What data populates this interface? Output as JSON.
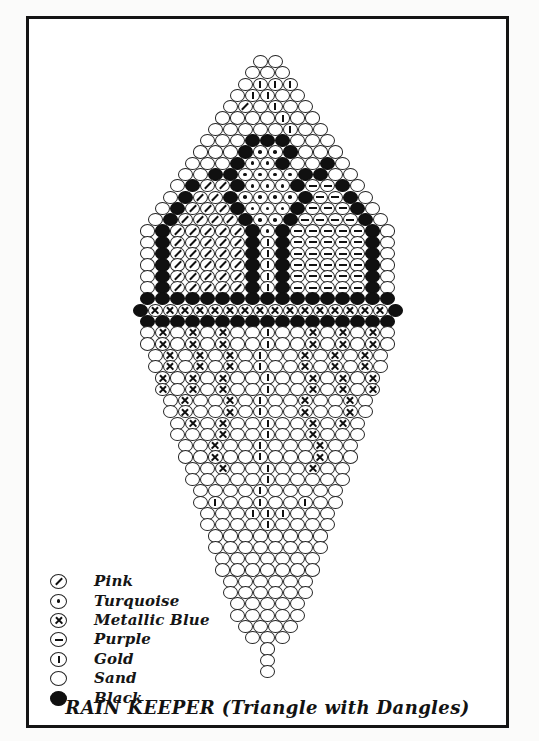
{
  "page": {
    "title": "RAIN KEEPER (Triangle with Dangles)"
  },
  "legend": {
    "items": [
      {
        "key": "P",
        "label": "Pink",
        "symbol": "circle-diagonal-slash"
      },
      {
        "key": "T",
        "label": "Turquoise",
        "symbol": "circle-center-dot"
      },
      {
        "key": "M",
        "label": "Metallic Blue",
        "symbol": "circle-x-cross"
      },
      {
        "key": "U",
        "label": "Purple",
        "symbol": "circle-horizontal-bar"
      },
      {
        "key": "G",
        "label": "Gold",
        "symbol": "circle-vertical-bar"
      },
      {
        "key": "S",
        "label": "Sand",
        "symbol": "circle-empty"
      },
      {
        "key": "B",
        "label": "Black",
        "symbol": "circle-filled"
      }
    ]
  },
  "pattern": {
    "colors": {
      "S": "Sand",
      "B": "Black",
      "P": "Pink",
      "T": "Turquoise",
      "M": "Metallic Blue",
      "U": "Purple",
      "G": "Gold"
    },
    "rows": [
      "SS",
      "SSS",
      "SGGG",
      "SGGSS",
      "SPSGSS",
      "SSSSGSS",
      "SSSSSGSS",
      "SSSBBBSSS",
      "SSSBTTBSSS",
      "SSSBTTBSSBS",
      "SSBBTTTTBBSS",
      "SBPPBTTTBUUBS",
      "SBPPBTTTTBUUBS",
      "SBPPPBTTTBUUUBS",
      "SBPPPPBTTBUUUUBS",
      "SBPPPPPBTBUUUUUBS",
      "SBPPPPPBGBUUUUUBS",
      "SBPPPPPBGBUUUUUBS",
      "SBPPPPPBGBUUUUUBS",
      "SBPPPPPBGBUUUUUBS",
      "SBPPPPPBGBUUUUUBS",
      "BBBBBBBBBBBBBBBBB",
      "BMMMMMMMMMMMMMMMMB",
      "BBBBBBBBBBBBBBBBB",
      "SMSMSMSSGSSMSMSMS",
      "SMSMSMSSGSSMSMSMS",
      "SMSMSMSGSSMSMSMS",
      "SMSMSMSGSSMSMSMS",
      "MSMSMSSGSSMSMSM",
      "MSMSMSSGSSMSMSM",
      "SMSSMSGSSMSSMS",
      "SMSSMSGSSMSSMS",
      "SMSMSSGSSMSMS",
      "SSSMSSGSSMSSS",
      "SSMSSGSSSMSS",
      "SSMSSGSSSMSS",
      "SSMSSGSSMSS",
      "SSSSSGSSSSS",
      "SSSSGSSSSS",
      "SGSSGSSGSS",
      "SSSGGGSSS",
      "SSSSGSSSS",
      "SSSSSSSS",
      "SSSSSSSS",
      "SSSSSSS",
      "SSSSSSS",
      "SSSSSS",
      "SSSSSS",
      "SSSSS",
      "SSSSS",
      "SSSS",
      "SSS",
      "S",
      "S",
      "S"
    ]
  }
}
